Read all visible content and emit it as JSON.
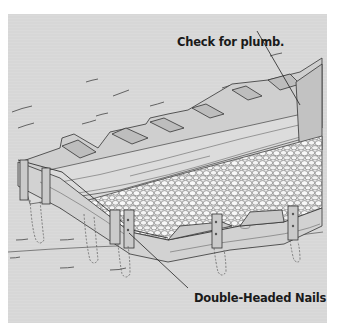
{
  "figure": {
    "background_color": "#d7d7d7",
    "line_color": "#333333",
    "labels": [
      {
        "id": "plumb",
        "text": "Check for plumb.",
        "points_to": "form board at far right corner"
      },
      {
        "id": "nails",
        "text": "Double-Headed Nails",
        "points_to": "nail heads on corner stake"
      }
    ]
  }
}
